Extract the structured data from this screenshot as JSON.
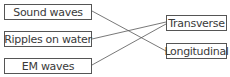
{
  "diagram": {
    "left_items": [
      {
        "label": "Sound waves"
      },
      {
        "label": "Ripples on water"
      },
      {
        "label": "EM waves"
      }
    ],
    "right_items": [
      {
        "label": "Transverse"
      },
      {
        "label": "Longitudinal"
      }
    ],
    "connections": [
      {
        "from": "Sound waves",
        "to": "Longitudinal"
      },
      {
        "from": "Ripples on water",
        "to": "Transverse"
      },
      {
        "from": "EM waves",
        "to": "Transverse"
      }
    ],
    "colors": {
      "line": "#555555",
      "border": "#555555",
      "text": "#3a3a3a"
    }
  }
}
